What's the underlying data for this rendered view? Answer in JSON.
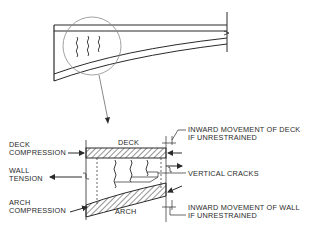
{
  "overview": {
    "description": "Cantilever deck-arch structure with circled detail region showing vertical cracks"
  },
  "detail": {
    "labels": {
      "deck": "DECK",
      "arch": "ARCH",
      "deck_compression_1": "DECK",
      "deck_compression_2": "COMPRESSION",
      "wall_tension_1": "WALL",
      "wall_tension_2": "TENSION",
      "arch_compression_1": "ARCH",
      "arch_compression_2": "COMPRESSION",
      "inward_deck_1": "INWARD MOVEMENT OF DECK",
      "inward_deck_2": "IF UNRESTRAINED",
      "vertical_cracks": "VERTICAL CRACKS",
      "inward_wall_1": "INWARD MOVEMENT OF WALL",
      "inward_wall_2": "IF UNRESTRAINED"
    }
  },
  "colors": {
    "line": "#2a2a2a",
    "circle": "#8a8a8a",
    "background": "#ffffff"
  }
}
